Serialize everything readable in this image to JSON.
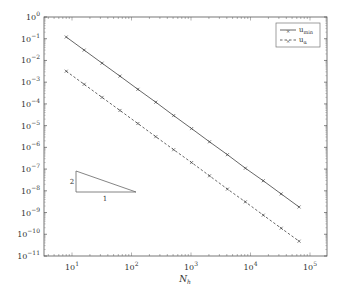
{
  "chart_data": {
    "type": "line",
    "title": "",
    "xlabel": "N_h",
    "ylabel": "",
    "xscale": "log",
    "yscale": "log",
    "xlim": [
      5,
      100000
    ],
    "ylim": [
      1e-11,
      1
    ],
    "x_ticks": [
      "10^1",
      "10^2",
      "10^3",
      "10^4",
      "10^5"
    ],
    "y_ticks": [
      "10^0",
      "10^-1",
      "10^-2",
      "10^-3",
      "10^-4",
      "10^-5",
      "10^-6",
      "10^-7",
      "10^-8",
      "10^-9",
      "10^-10",
      "10^-11"
    ],
    "grid": false,
    "legend_position": "upper right",
    "x": [
      8,
      16,
      32,
      64,
      128,
      256,
      512,
      1024,
      2048,
      4096,
      8192,
      16384,
      32768,
      65536
    ],
    "series": [
      {
        "name": "u_min",
        "style": "solid",
        "marker": "x",
        "values": [
          0.12,
          0.03,
          0.0075,
          0.0019,
          0.00047,
          0.00012,
          2.9e-05,
          7.3e-06,
          1.8e-06,
          4.6e-07,
          1.1e-07,
          2.9e-08,
          7.2e-09,
          1.8e-09
        ]
      },
      {
        "name": "u_α",
        "style": "dashed",
        "marker": "x",
        "values": [
          0.0032,
          0.0008,
          0.0002,
          5e-05,
          1.25e-05,
          3.1e-06,
          7.8e-07,
          2e-07,
          4.9e-08,
          1.2e-08,
          3.1e-09,
          7.6e-10,
          1.9e-10,
          4.8e-11
        ]
      }
    ],
    "annotations": [
      {
        "type": "slope-triangle",
        "rise_label": "2",
        "run_label": "1"
      }
    ]
  },
  "legend": {
    "items": [
      {
        "base": "u",
        "sub": "min"
      },
      {
        "base": "u",
        "sub": "α"
      }
    ]
  },
  "axes": {
    "xlabel_base": "N",
    "xlabel_sub": "h",
    "x_tick_exps": [
      "1",
      "2",
      "3",
      "4",
      "5"
    ],
    "y_tick_exps": [
      "0",
      "−1",
      "−2",
      "−3",
      "−4",
      "−5",
      "−6",
      "−7",
      "−8",
      "−9",
      "−10",
      "−11"
    ]
  },
  "triangle": {
    "rise": "2",
    "run": "1"
  }
}
